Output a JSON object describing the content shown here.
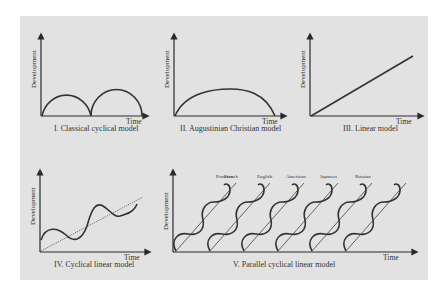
{
  "figure": {
    "background_color": "#e2e2e2",
    "line_color": "#333333",
    "axis_labels": {
      "y": "Development",
      "x": "Time"
    },
    "panels": [
      {
        "id": "I",
        "caption": "I. Classical cyclical model",
        "shape": "two adjacent semicircular arches"
      },
      {
        "id": "II",
        "caption": "II. Augustinian Christian model",
        "shape": "single broad arch"
      },
      {
        "id": "III",
        "caption": "III. Linear model",
        "shape": "straight rising diagonal line"
      },
      {
        "id": "IV",
        "caption": "IV. Cyclical linear model",
        "shape": "wave oscillating around a rising dotted trend line"
      },
      {
        "id": "V",
        "caption": "V. Parallel cyclical linear model",
        "shape": "six parallel rising waves, each with its own trend line",
        "nations": [
          "Prussian",
          "French",
          "English",
          "American",
          "Japanese",
          "Russian"
        ]
      }
    ]
  }
}
